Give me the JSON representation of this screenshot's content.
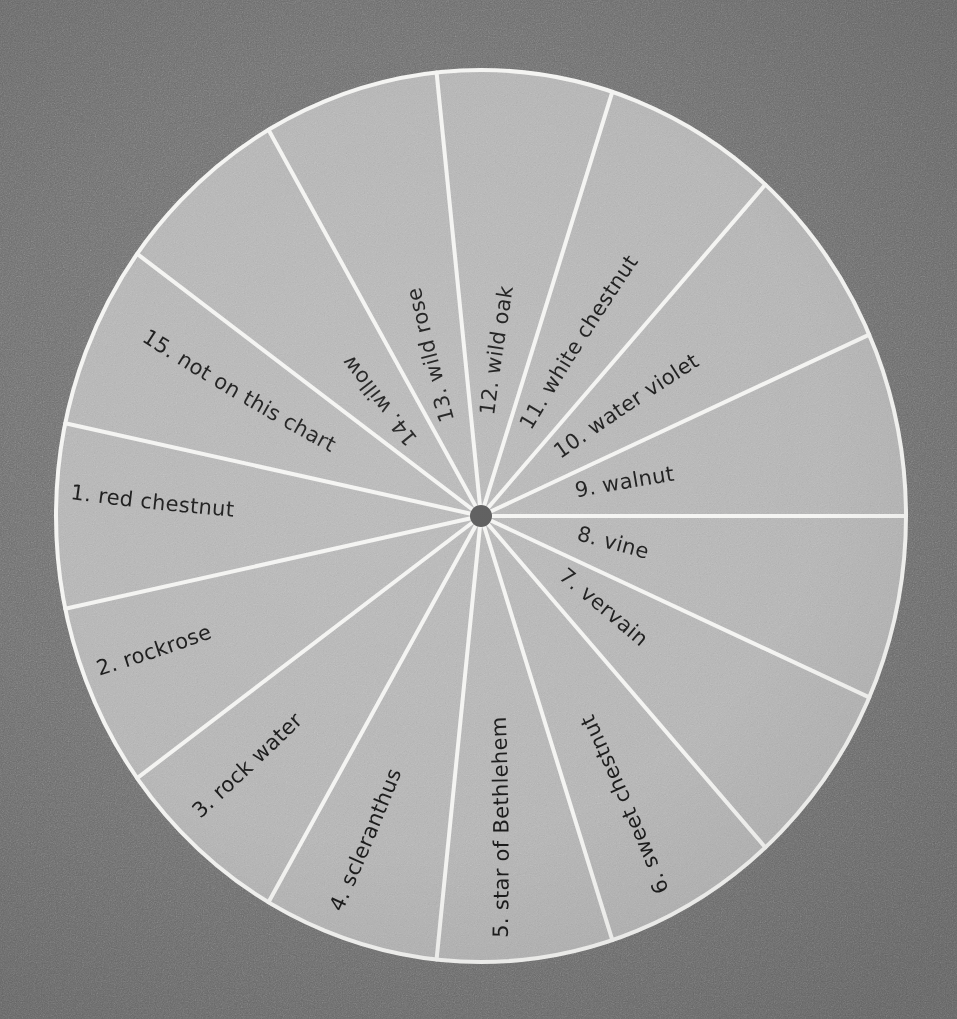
{
  "chart_data": {
    "type": "pie",
    "categories": [
      "1. red chestnut",
      "2. rockrose",
      "3. rock water",
      "4. scleranthus",
      "5. star of Bethlehem",
      "6. sweet chestnut",
      "7. vervain",
      "8. vine",
      "9. walnut",
      "10. water violet",
      "11. white chestnut",
      "12. wild oak",
      "13. wild rose",
      "14. willow",
      "15. not on this chart"
    ],
    "values": [
      1,
      1,
      1,
      1,
      1,
      1,
      1,
      1,
      1,
      1,
      1,
      1,
      1,
      1,
      1
    ],
    "slice_count": 15,
    "slice_angle_degrees": 24,
    "xlabel": "",
    "ylabel": "",
    "legend": "none",
    "grid": false
  },
  "wheel": {
    "center_x": 481,
    "center_y": 516,
    "radius_x": 425,
    "radius_y": 446,
    "hub_radius": 11,
    "label_radius_fraction": 0.72,
    "start_angle_degrees": -90,
    "slices": [
      {
        "index": 1,
        "label": "1.  red chestnut",
        "mid_angle": 180,
        "flip": false,
        "label_r": 0.78
      },
      {
        "index": 2,
        "label": "2. rockrose",
        "mid_angle": 156,
        "flip": false,
        "label_r": 0.78
      },
      {
        "index": 3,
        "label": "3. rock water",
        "mid_angle": 132,
        "flip": false,
        "label_r": 0.76
      },
      {
        "index": 4,
        "label": "4. scleranthus",
        "mid_angle": 108,
        "flip": false,
        "label_r": 0.76
      },
      {
        "index": 5,
        "label": "5. star of Bethlehem",
        "mid_angle": 84,
        "flip": false,
        "label_r": 0.76
      },
      {
        "index": 6,
        "label": "6. sweet chestnut",
        "mid_angle": 60,
        "flip": false,
        "label_r": 0.76
      },
      {
        "index": 7,
        "label": "7. vervain",
        "mid_angle": 36,
        "flip": true,
        "label_r": 0.8
      },
      {
        "index": 8,
        "label": "8. vine",
        "mid_angle": 12,
        "flip": true,
        "label_r": 0.82
      },
      {
        "index": 9,
        "label": "9. walnut",
        "mid_angle": -12,
        "flip": true,
        "label_r": 0.8
      },
      {
        "index": 10,
        "label": "10. water violet",
        "mid_angle": -36,
        "flip": true,
        "label_r": 0.76
      },
      {
        "index": 11,
        "label": "11. white chestnut",
        "mid_angle": -60,
        "flip": true,
        "label_r": 0.74
      },
      {
        "index": 12,
        "label": "12. wild oak",
        "mid_angle": -84,
        "flip": true,
        "label_r": 0.78
      },
      {
        "index": 13,
        "label": "13. wild rose",
        "mid_angle": -108,
        "flip": true,
        "label_r": 0.76
      },
      {
        "index": 14,
        "label": "14. willow",
        "mid_angle": -132,
        "flip": true,
        "label_r": 0.8
      },
      {
        "index": 15,
        "label": "15.  not on this chart",
        "mid_angle": -156,
        "flip": false,
        "label_r": 0.7
      }
    ]
  },
  "colors": {
    "background": "#6e6e6e",
    "disc_fill": "#b8b8b8",
    "spoke_stroke": "#f4f4f2",
    "hub_fill": "#595959",
    "label_text": "#1c1c1c"
  },
  "typography": {
    "label_font_size": 21
  }
}
